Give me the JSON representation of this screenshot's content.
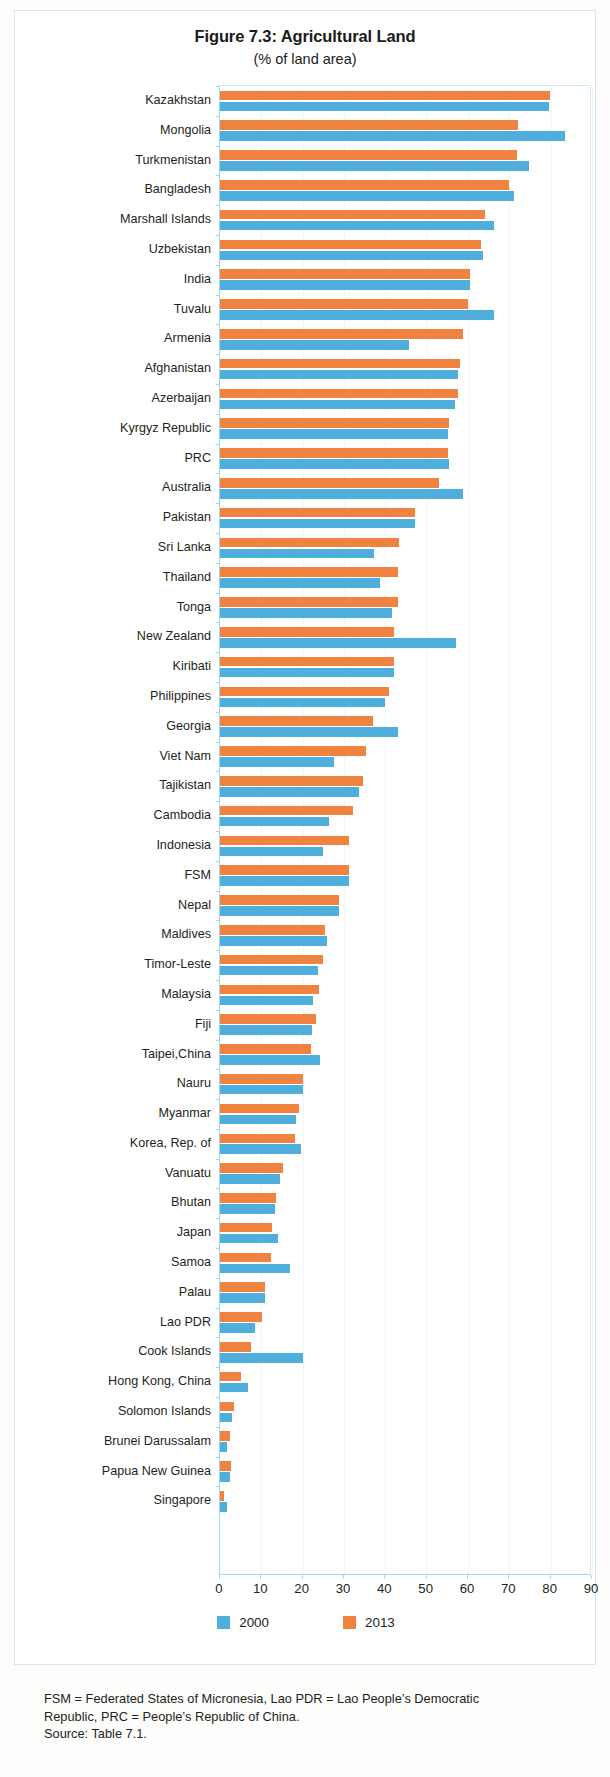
{
  "figure": {
    "title": "Figure 7.3:  Agricultural Land",
    "subtitle": "(% of land area)"
  },
  "legend": {
    "items": [
      {
        "label": "2000",
        "color": "#4fafdc"
      },
      {
        "label": "2013",
        "color": "#f0833f"
      }
    ]
  },
  "notes": {
    "line1": "FSM = Federated States of Micronesia, Lao PDR = Lao People’s Democratic",
    "line2": "Republic, PRC = People’s Republic of China.",
    "line3": "Source: Table 7.1."
  },
  "chart_data": {
    "type": "bar",
    "orientation": "horizontal",
    "title": "Figure 7.3:  Agricultural Land",
    "subtitle": "(% of land area)",
    "xlabel": "",
    "ylabel": "",
    "xlim": [
      0,
      90
    ],
    "xticks": [
      0,
      10,
      20,
      30,
      40,
      50,
      60,
      70,
      80,
      90
    ],
    "grid": true,
    "legend_position": "bottom",
    "categories": [
      "Kazakhstan",
      "Mongolia",
      "Turkmenistan",
      "Bangladesh",
      "Marshall Islands",
      "Uzbekistan",
      "India",
      "Tuvalu",
      "Armenia",
      "Afghanistan",
      "Azerbaijan",
      "Kyrgyz Republic",
      "PRC",
      "Australia",
      "Pakistan",
      "Sri Lanka",
      "Thailand",
      "Tonga",
      "New Zealand",
      "Kiribati",
      "Philippines",
      "Georgia",
      "Viet Nam",
      "Tajikistan",
      "Cambodia",
      "Indonesia",
      "FSM",
      "Nepal",
      "Maldives",
      "Timor-Leste",
      "Malaysia",
      "Fiji",
      "Taipei,China",
      "Nauru",
      "Myanmar",
      "Korea, Rep. of",
      "Vanuatu",
      "Bhutan",
      "Japan",
      "Samoa",
      "Palau",
      "Lao PDR",
      "Cook Islands",
      "Hong Kong, China",
      "Solomon Islands",
      "Brunei Darussalam",
      "Papua New Guinea",
      "Singapore"
    ],
    "series": [
      {
        "name": "2000",
        "color": "#4fafdc",
        "values": [
          79.5,
          83.5,
          74.8,
          71.2,
          66.3,
          63.7,
          60.4,
          66.3,
          45.8,
          57.6,
          56.8,
          55.2,
          55.3,
          58.8,
          47.2,
          37.2,
          38.8,
          41.5,
          57.1,
          42.0,
          39.8,
          43.0,
          27.5,
          33.7,
          26.4,
          24.8,
          31.2,
          28.8,
          26.0,
          23.7,
          22.4,
          22.3,
          24.2,
          20.0,
          18.5,
          19.5,
          14.6,
          13.2,
          14.1,
          17.0,
          10.8,
          8.4,
          20.0,
          6.7,
          3.0,
          1.8,
          2.3,
          1.8
        ]
      },
      {
        "name": "2013",
        "color": "#f0833f",
        "values": [
          79.8,
          72.0,
          71.9,
          70.0,
          64.0,
          63.1,
          60.4,
          60.0,
          58.9,
          58.1,
          57.6,
          55.3,
          55.2,
          52.9,
          47.1,
          43.3,
          43.0,
          43.1,
          42.1,
          42.0,
          41.0,
          37.0,
          35.3,
          34.6,
          32.1,
          31.2,
          31.2,
          28.8,
          25.5,
          25.0,
          23.9,
          23.3,
          22.0,
          20.0,
          19.2,
          18.1,
          15.3,
          13.6,
          12.5,
          12.4,
          10.8,
          10.2,
          7.5,
          5.0,
          3.4,
          2.5,
          2.6,
          0.9
        ]
      }
    ]
  }
}
